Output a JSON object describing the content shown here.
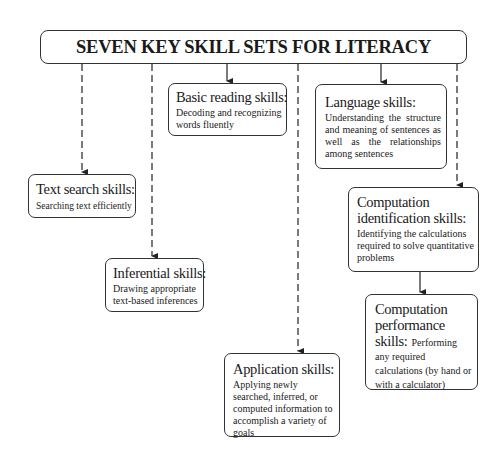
{
  "diagram": {
    "title": "SEVEN KEY SKILL SETS FOR LITERACY",
    "skills": [
      {
        "id": "text-search",
        "title": "Text search skills:",
        "description": "Searching text efficiently"
      },
      {
        "id": "inferential",
        "title": "Inferential skills:",
        "description": "Drawing appropriate text-based inferences"
      },
      {
        "id": "basic-reading",
        "title": "Basic reading skills:",
        "description": "Decoding and recognizing words fluently"
      },
      {
        "id": "application",
        "title": "Application skills:",
        "description": "Applying newly searched, inferred, or computed information to accomplish a variety of goals"
      },
      {
        "id": "language",
        "title": "Language skills:",
        "description": "Understanding the structure and meaning of sentences as well as the relationships among sentences"
      },
      {
        "id": "computation-identification",
        "title": "Computation identification skills:",
        "description": "Identifying the calculations required to solve quantitative problems"
      },
      {
        "id": "computation-performance",
        "title_line1": "Computation",
        "title_line2": "performance",
        "title_line3": "skills:",
        "description": "Performing any required calculations (by hand or with a calculator)"
      }
    ],
    "connectors": [
      {
        "from": "title",
        "to": "text-search",
        "style": "dashed"
      },
      {
        "from": "title",
        "to": "inferential",
        "style": "dashed"
      },
      {
        "from": "title",
        "to": "basic-reading",
        "style": "solid"
      },
      {
        "from": "title",
        "to": "application",
        "style": "dashed"
      },
      {
        "from": "title",
        "to": "language",
        "style": "solid"
      },
      {
        "from": "title",
        "to": "computation-identification",
        "style": "dashed"
      },
      {
        "from": "computation-identification",
        "to": "computation-performance",
        "style": "solid"
      }
    ]
  },
  "colors": {
    "line": "#333333",
    "text": "#1a1a1a",
    "background": "#ffffff"
  }
}
